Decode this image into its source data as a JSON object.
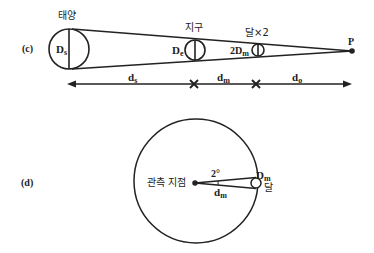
{
  "panel_c": {
    "label": "(c)",
    "sun": {
      "name": "태양",
      "diameter_label": "D",
      "diameter_sub": "s"
    },
    "earth": {
      "name": "지구",
      "diameter_label": "D",
      "diameter_sub": "e"
    },
    "moon": {
      "name": "달×2",
      "diameter_label": "2D",
      "diameter_sub": "m"
    },
    "point": "P",
    "distances": [
      {
        "label": "d",
        "sub": "s"
      },
      {
        "label": "d",
        "sub": "m"
      },
      {
        "label": "d",
        "sub": "o"
      }
    ]
  },
  "panel_d": {
    "label": "(d)",
    "observer": "관측 지점",
    "angle": "2°",
    "distance": {
      "label": "d",
      "sub": "m"
    },
    "moon_diameter": {
      "label": "D",
      "sub": "m"
    },
    "moon_name": "달"
  },
  "colors": {
    "stroke": "#222222",
    "background": "#ffffff"
  }
}
